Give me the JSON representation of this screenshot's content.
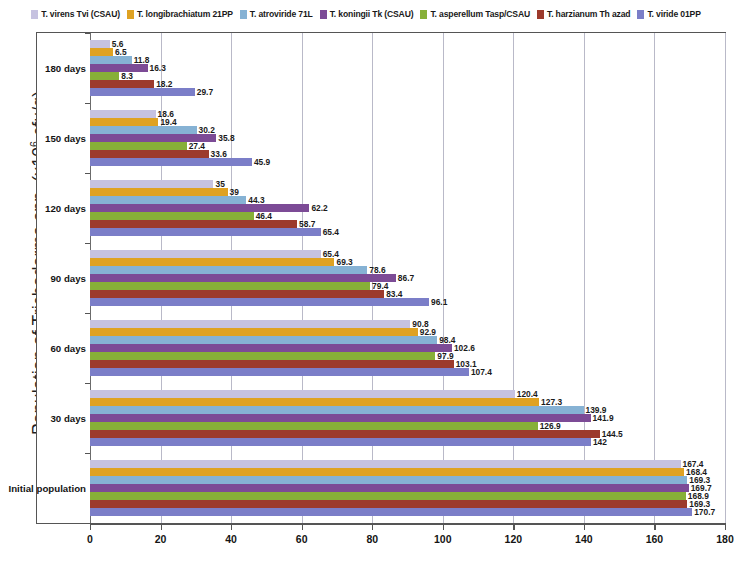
{
  "chart_data": {
    "type": "bar",
    "orientation": "horizontal",
    "title": "",
    "xlabel": "",
    "ylabel": "Population of Trichoderma spp.  (x106 cfu/g)",
    "ylabel_main": "Population of Trichoderma spp.  (x10",
    "ylabel_sup": "6",
    "ylabel_tail": " cfu/g)",
    "xlim": [
      0,
      180
    ],
    "xticks": [
      0,
      20,
      40,
      60,
      80,
      100,
      120,
      140,
      160,
      180
    ],
    "xtick_labels": [
      "0",
      "20",
      "40",
      "60",
      "80",
      "100",
      "120",
      "140",
      "160",
      "180"
    ],
    "grid": true,
    "grid_axis": "x",
    "legend_position": "top",
    "categories": [
      "Initial population",
      "30 days",
      "60 days",
      "90 days",
      "120 days",
      "150 days",
      "180 days"
    ],
    "series": [
      {
        "name": "T. virens Tvi (CSAU)",
        "color": "#c6c2e0",
        "values": [
          167.4,
          120.4,
          90.8,
          65.4,
          35,
          18.6,
          5.6
        ],
        "labels": [
          "167.4",
          "120.4",
          "90.8",
          "65.4",
          "35",
          "18.6",
          "5.6"
        ]
      },
      {
        "name": "T. longibrachiatum 21PP",
        "color": "#dfa222",
        "values": [
          168.4,
          127.3,
          92.9,
          69.3,
          39,
          19.4,
          6.5
        ],
        "labels": [
          "168.4",
          "127.3",
          "69.3",
          "69.3",
          "39",
          "19.4",
          "6.5"
        ]
      },
      {
        "name": "T. atroviride 71L",
        "color": "#86b2d4",
        "values": [
          169.3,
          139.9,
          98.4,
          78.6,
          44.3,
          30.2,
          11.8
        ],
        "labels": [
          "169.3",
          "139.9",
          "98.4",
          "78.6",
          "44.3",
          "30.2",
          "11.8"
        ]
      },
      {
        "name": "T. koningii Tk (CSAU)",
        "color": "#7c4b96",
        "values": [
          169.7,
          141.9,
          102.6,
          86.7,
          62.2,
          35.8,
          16.3
        ],
        "labels": [
          "169.7",
          "141.9",
          "102.6",
          "86.7",
          "62.2",
          "35.8",
          "16.3"
        ]
      },
      {
        "name": "T. asperellum Tasp/CSAU",
        "color": "#87b038",
        "values": [
          168.9,
          126.9,
          97.9,
          79.4,
          46.4,
          27.4,
          8.3
        ],
        "labels": [
          "168.9",
          "126.9",
          "97.9",
          "79.4",
          "46.4",
          "27.4",
          "8.3"
        ]
      },
      {
        "name": "T. harzianum Th azad",
        "color": "#9c3a2c",
        "values": [
          169.3,
          144.5,
          103.1,
          83.4,
          58.7,
          33.6,
          18.2
        ],
        "labels": [
          "169.3",
          "144.5",
          "103.1",
          "83.4",
          "58.7",
          "33.6",
          "18.2"
        ]
      },
      {
        "name": "T. viride 01PP",
        "color": "#7b7ec8",
        "values": [
          170.7,
          142,
          107.4,
          96.1,
          65.4,
          45.9,
          29.7
        ],
        "labels": [
          "170.7",
          "142",
          "107.4",
          "96.1",
          "65.4",
          "45.9",
          "29.7"
        ]
      }
    ]
  },
  "legend": {
    "items": [
      {
        "label": "T. virens Tvi (CSAU)",
        "color": "#c6c2e0"
      },
      {
        "label": "T. longibrachiatum  21PP",
        "color": "#dfa222"
      },
      {
        "label": "T. atroviride 71L",
        "color": "#86b2d4"
      },
      {
        "label": "T. koningii Tk (CSAU)",
        "color": "#7c4b96"
      },
      {
        "label": "T. asperellum Tasp/CSAU",
        "color": "#87b038"
      },
      {
        "label": "T. harzianum Th azad",
        "color": "#9c3a2c"
      },
      {
        "label": "T. viride 01PP",
        "color": "#7b7ec8"
      }
    ]
  }
}
